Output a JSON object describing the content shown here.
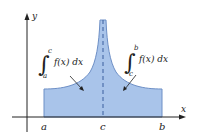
{
  "figure": {
    "axes": {
      "x_label": "x",
      "y_label": "y"
    },
    "ticks": {
      "a": "a",
      "c": "c",
      "b": "b"
    },
    "left_integral": {
      "symbol": "∫",
      "lower": "a",
      "upper": "c",
      "integrand": "f(x) dx"
    },
    "right_integral": {
      "symbol": "∫",
      "lower": "c",
      "upper": "b",
      "integrand": "f(x) dx"
    },
    "colors": {
      "fill": "#a9c4ea",
      "outline": "#6d8fc6",
      "axis": "#222222",
      "dashed_line": "#3b5f9e"
    }
  }
}
